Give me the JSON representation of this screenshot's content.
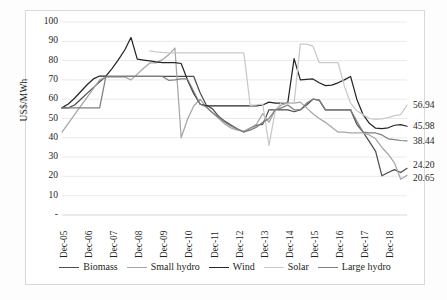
{
  "axis": {
    "ylabel": "US$/MWh",
    "yticks": [
      "100",
      "90",
      "80",
      "70",
      "60",
      "50",
      "40",
      "30",
      "20",
      "10",
      "-"
    ],
    "ylim": [
      0,
      100
    ],
    "xticks": [
      "Dec-05",
      "Dec-06",
      "Dec-07",
      "Dec-08",
      "Dec-09",
      "Dec-10",
      "Dec-11",
      "Dec-12",
      "Dec-13",
      "Dec-14",
      "Dec-15",
      "Dec-16",
      "Dec-17",
      "Dec-18"
    ],
    "grid": "horizontal"
  },
  "legend": {
    "position": "bottom",
    "items": [
      {
        "label": "Biomass",
        "color": "#4d4d4d"
      },
      {
        "label": "Small hydro",
        "color": "#a6a6a6"
      },
      {
        "label": "Wind",
        "color": "#262626"
      },
      {
        "label": "Solar",
        "color": "#c9c9c9"
      },
      {
        "label": "Large hydro",
        "color": "#7f7f7f"
      }
    ]
  },
  "end_labels": [
    {
      "text": "56.94",
      "value": 56.94,
      "series": "Solar"
    },
    {
      "text": "45.98",
      "value": 45.98,
      "series": "Wind"
    },
    {
      "text": "38.44",
      "value": 38.44,
      "series": "Large hydro"
    },
    {
      "text": "24.20",
      "value": 24.2,
      "series": "Biomass"
    },
    {
      "text": "20.65",
      "value": 20.65,
      "series": "Small hydro"
    }
  ],
  "chart_data": {
    "type": "line",
    "title": "",
    "xlabel": "",
    "ylabel": "US$/MWh",
    "ylim": [
      0,
      100
    ],
    "categories": [
      "Dec-05",
      "Dec-06",
      "Dec-07",
      "Dec-08",
      "Dec-09",
      "Dec-10",
      "Dec-11",
      "Dec-12",
      "Dec-13",
      "Dec-14",
      "Dec-15",
      "Dec-16",
      "Dec-17",
      "Dec-18",
      "Dec-19"
    ],
    "x_subdivisions": 4,
    "series": [
      {
        "name": "Biomass",
        "color": "#4d4d4d",
        "x": [
          0,
          1,
          2,
          3,
          4,
          5,
          6,
          7,
          8,
          9,
          10,
          11,
          12,
          13,
          14,
          15,
          16,
          17,
          18,
          19,
          20,
          21,
          22,
          23,
          24,
          25,
          26,
          27,
          28,
          29,
          30,
          31,
          32,
          33,
          34,
          35,
          36,
          37,
          38,
          39,
          40,
          41,
          42,
          43,
          44,
          45,
          46,
          47,
          48,
          49,
          50,
          51,
          52,
          53,
          54,
          55
        ],
        "values": [
          55.5,
          55.5,
          57.0,
          60.0,
          63.0,
          66.0,
          69.0,
          71.8,
          71.8,
          71.8,
          71.8,
          71.8,
          71.8,
          71.8,
          71.8,
          71.8,
          71.8,
          71.8,
          71.8,
          71.8,
          71.8,
          71.8,
          63.5,
          57.0,
          55.0,
          51.0,
          48.5,
          46.5,
          44.5,
          43.0,
          45.0,
          46.5,
          47.0,
          54.5,
          54.5,
          54.5,
          54.5,
          53.5,
          54.5,
          57.0,
          60.0,
          59.5,
          54.5,
          54.5,
          54.5,
          54.5,
          54.5,
          47.0,
          43.0,
          38.0,
          33.0,
          20.3,
          22.0,
          23.5,
          22.0,
          24.2
        ]
      },
      {
        "name": "Small hydro",
        "color": "#a6a6a6",
        "x": [
          0,
          1,
          2,
          3,
          4,
          5,
          6,
          7,
          8,
          9,
          10,
          11,
          12,
          13,
          14,
          15,
          16,
          17,
          18,
          19,
          20,
          21,
          22,
          23,
          24,
          25,
          26,
          27,
          28,
          29,
          30,
          31,
          32,
          33,
          34,
          35,
          36,
          37,
          38,
          39,
          40,
          41,
          42,
          43,
          44,
          45,
          46,
          47,
          48,
          49,
          50,
          51,
          52,
          53,
          54,
          55
        ],
        "values": [
          43.0,
          47.5,
          52.0,
          56.5,
          61.0,
          65.5,
          70.0,
          71.5,
          71.5,
          71.5,
          71.5,
          70.0,
          73.0,
          76.0,
          78.8,
          78.8,
          80.5,
          83.0,
          86.5,
          40.0,
          49.5,
          56.5,
          60.0,
          56.0,
          53.0,
          50.0,
          47.0,
          45.0,
          44.0,
          43.5,
          45.0,
          47.0,
          52.5,
          48.0,
          54.5,
          57.0,
          58.0,
          58.0,
          58.5,
          55.5,
          52.5,
          50.0,
          48.0,
          45.5,
          43.0,
          43.0,
          42.5,
          42.5,
          42.5,
          41.5,
          39.5,
          35.0,
          31.5,
          27.0,
          18.5,
          20.65
        ]
      },
      {
        "name": "Wind",
        "color": "#262626",
        "x": [
          0,
          1,
          2,
          3,
          4,
          5,
          6,
          7,
          8,
          9,
          10,
          11,
          12,
          13,
          14,
          15,
          16,
          17,
          18,
          19,
          20,
          21,
          22,
          23,
          24,
          25,
          26,
          27,
          28,
          29,
          30,
          31,
          32,
          33,
          34,
          35,
          36,
          37,
          38,
          39,
          40,
          41,
          42,
          43,
          44,
          45,
          46,
          47,
          48,
          49,
          50,
          51,
          52,
          53,
          54,
          55
        ],
        "values": [
          55.5,
          57.5,
          60.5,
          64.0,
          67.5,
          70.5,
          72.0,
          72.0,
          76.0,
          80.5,
          85.5,
          92.0,
          80.8,
          80.3,
          79.8,
          79.3,
          79.0,
          79.0,
          79.0,
          78.5,
          70.0,
          63.0,
          57.5,
          56.5,
          56.5,
          56.5,
          56.5,
          56.5,
          56.5,
          56.5,
          56.5,
          56.5,
          57.0,
          58.5,
          58.0,
          58.0,
          58.3,
          81.0,
          70.0,
          70.3,
          70.5,
          68.5,
          67.0,
          67.3,
          68.5,
          70.0,
          71.8,
          60.0,
          52.0,
          47.5,
          45.0,
          44.8,
          45.2,
          46.5,
          46.8,
          45.98
        ]
      },
      {
        "name": "Solar",
        "color": "#c9c9c9",
        "x": [
          14,
          15,
          16,
          17,
          18,
          19,
          20,
          21,
          22,
          23,
          24,
          25,
          26,
          27,
          28,
          29,
          30,
          31,
          32,
          33,
          34,
          35,
          36,
          37,
          38,
          39,
          40,
          41,
          42,
          43,
          44,
          45,
          46,
          47,
          48,
          49,
          50,
          51,
          52,
          53,
          54,
          55
        ],
        "values": [
          85.0,
          84.5,
          84.2,
          84.0,
          84.0,
          84.0,
          84.0,
          84.0,
          84.0,
          84.0,
          84.0,
          84.0,
          84.0,
          84.0,
          84.0,
          84.0,
          56.8,
          57.0,
          57.5,
          36.0,
          54.0,
          58.5,
          58.0,
          58.0,
          88.5,
          88.5,
          87.5,
          79.0,
          79.0,
          79.0,
          79.0,
          67.0,
          58.0,
          54.0,
          52.0,
          50.0,
          49.5,
          49.8,
          50.5,
          51.5,
          52.0,
          56.94
        ]
      },
      {
        "name": "Large hydro",
        "color": "#7f7f7f",
        "x": [
          0,
          1,
          2,
          3,
          4,
          5,
          6,
          7,
          8,
          9,
          10,
          11,
          12,
          13,
          14,
          15,
          16,
          17,
          18,
          19,
          20,
          21,
          22,
          23,
          24,
          25,
          26,
          27,
          28,
          29,
          30,
          31,
          32,
          33,
          34,
          35,
          36,
          37,
          38,
          39,
          40,
          41,
          42,
          43,
          44,
          45,
          46,
          47,
          48,
          49,
          50,
          51,
          52,
          53,
          54,
          55
        ],
        "values": [
          55.5,
          55.5,
          55.5,
          55.5,
          55.5,
          55.5,
          55.5,
          71.8,
          71.8,
          71.8,
          71.8,
          71.8,
          71.8,
          71.8,
          71.8,
          71.8,
          71.8,
          69.8,
          70.0,
          70.5,
          70.5,
          64.0,
          57.5,
          56.0,
          53.0,
          50.5,
          48.0,
          46.0,
          44.5,
          43.0,
          44.0,
          45.5,
          48.0,
          50.0,
          54.5,
          55.5,
          57.0,
          54.5,
          54.5,
          58.0,
          60.0,
          59.5,
          54.5,
          54.5,
          54.5,
          54.5,
          54.5,
          48.5,
          43.0,
          42.5,
          42.5,
          41.5,
          39.5,
          39.0,
          38.6,
          38.44
        ]
      }
    ]
  }
}
